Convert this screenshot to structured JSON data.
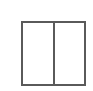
{
  "icon": {
    "name": "two-column-layout-icon",
    "columns": 2,
    "stroke_color": "#5a5a5a",
    "background": "#ffffff"
  }
}
